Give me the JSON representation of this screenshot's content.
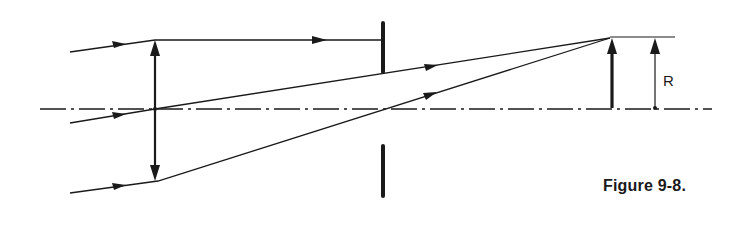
{
  "figure": {
    "caption": "Figure 9-8.",
    "dimension_label": "R",
    "colors": {
      "ink": "#1a1a1a",
      "background": "#ffffff"
    }
  },
  "elements": {
    "optical_axis": {
      "style": "dash-dot",
      "y": 109,
      "x1": 40,
      "x2": 712
    },
    "lens": {
      "type": "converging-lens-double-arrow",
      "x": 155,
      "y_top": 40,
      "y_bottom": 181
    },
    "aperture_stop": {
      "x": 383,
      "upper": [
        22,
        73
      ],
      "lower": [
        145,
        197
      ]
    },
    "image_arrow": {
      "x": 612,
      "y_base": 108,
      "y_tip": 38
    },
    "dimension_R": {
      "x": 655,
      "y_base": 108,
      "y_tip": 38
    },
    "rays": [
      {
        "name": "upper-ray",
        "points": [
          [
            70,
            52
          ],
          [
            155,
            40
          ],
          [
            383,
            40
          ]
        ]
      },
      {
        "name": "chief-ray",
        "points": [
          [
            70,
            123
          ],
          [
            155,
            109
          ],
          [
            610,
            38
          ]
        ]
      },
      {
        "name": "lower-ray",
        "points": [
          [
            70,
            193
          ],
          [
            158,
            181
          ],
          [
            610,
            38
          ]
        ]
      }
    ]
  }
}
